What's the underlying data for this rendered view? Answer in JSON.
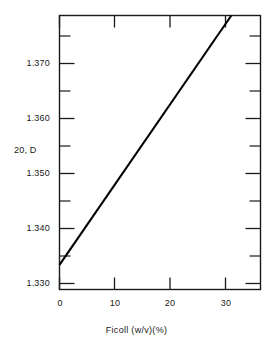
{
  "chart_data": {
    "type": "line",
    "title": "",
    "subtitle": "",
    "xlabel": "Ficoll  (w/v)(%)",
    "ylabel": "20, D",
    "xlim": [
      0,
      36.5
    ],
    "ylim": [
      1.3285,
      1.3775
    ],
    "grid": false,
    "legend": null,
    "x_major_ticks": [
      0,
      10,
      20,
      30
    ],
    "x_major_tick_labels": [
      "0",
      "10",
      "20",
      "30"
    ],
    "y_major_ticks": [
      1.33,
      1.34,
      1.35,
      1.36,
      1.37
    ],
    "y_major_tick_labels": [
      "1.330",
      "1.340",
      "1.350",
      "1.360",
      "1.370"
    ],
    "y_minor_ticks": [
      1.335,
      1.345,
      1.355,
      1.365,
      1.375
    ],
    "series": [
      {
        "name": "Ficoll refractive index",
        "x": [
          0,
          31.2
        ],
        "values": [
          1.3329,
          1.3775
        ],
        "color": "#000000",
        "line_width": 2.1
      }
    ],
    "annotations": []
  },
  "axis_labels": {
    "y_axis_caption": "20, D",
    "x_axis_caption": "Ficoll  (w/v)(%)"
  },
  "colors": {
    "background": "#ffffff",
    "axis": "#1a1a1a",
    "data_line": "#000000",
    "text": "#1a1a1a"
  }
}
